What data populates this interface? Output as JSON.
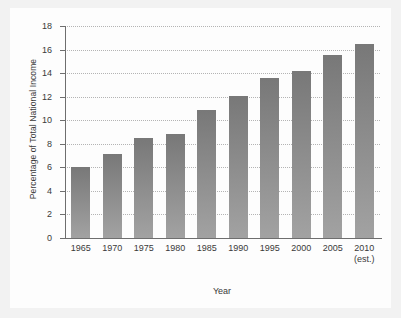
{
  "chart_data": {
    "type": "bar",
    "title": "",
    "xlabel": "Year",
    "ylabel": "Percentage of Total National Income",
    "categories": [
      "1965",
      "1970",
      "1975",
      "1980",
      "1985",
      "1990",
      "1995",
      "2000",
      "2005",
      "2010"
    ],
    "category_sublabels": [
      "",
      "",
      "",
      "",
      "",
      "",
      "",
      "",
      "",
      "(est.)"
    ],
    "values": [
      6.0,
      7.1,
      8.5,
      8.8,
      10.9,
      12.1,
      13.6,
      14.2,
      15.5,
      16.5
    ],
    "ylim": [
      0,
      18
    ],
    "ytick_labels": [
      "0",
      "2",
      "4",
      "6",
      "8",
      "10",
      "12",
      "14",
      "16",
      "18"
    ],
    "ytick_values": [
      0,
      2,
      4,
      6,
      8,
      10,
      12,
      14,
      16,
      18
    ],
    "grid": true,
    "grid_style": "dotted",
    "legend": "none",
    "series": [
      {
        "name": "Percentage of Total National Income",
        "values": [
          6.0,
          7.1,
          8.5,
          8.8,
          10.9,
          12.1,
          13.6,
          14.2,
          15.5,
          16.5
        ]
      }
    ],
    "colors": {
      "bar_top": "#787878",
      "bar_bottom": "#a2a2a2",
      "axis": "#6e6e6e",
      "grid": "#b4b4b4",
      "text": "#3a3a3a",
      "panel_background": "#fdfdfd",
      "figure_background": "#f2f2f2"
    }
  }
}
